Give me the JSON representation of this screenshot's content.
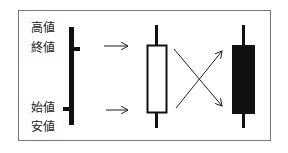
{
  "labels": {
    "high": "高値",
    "close": "終値",
    "open": "始値",
    "low": "安値"
  },
  "candles": [
    {
      "name": "bullish",
      "fill": "#ffffff",
      "stroke": "#111111"
    },
    {
      "name": "bearish",
      "fill": "#111111",
      "stroke": "#111111"
    }
  ],
  "colors": {
    "ink": "#111111",
    "frame": "#777777",
    "background": "#ffffff"
  }
}
